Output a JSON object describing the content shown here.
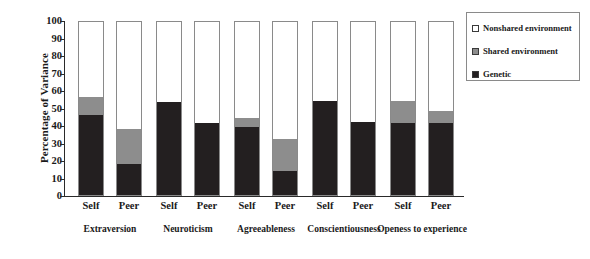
{
  "chart_data": {
    "type": "bar",
    "stacked": true,
    "title": "",
    "xlabel": "",
    "ylabel": "Percentage of Variance",
    "ylim": [
      0,
      100
    ],
    "ytick_step": 10,
    "yticks": [
      0,
      10,
      20,
      30,
      40,
      50,
      60,
      70,
      80,
      90,
      100
    ],
    "grid": false,
    "legend_position": "top-right",
    "categories": [
      "Self",
      "Peer",
      "Self",
      "Peer",
      "Self",
      "Peer",
      "Self",
      "Peer",
      "Self",
      "Peer"
    ],
    "groups": [
      "Extraversion",
      "Neuroticism",
      "Agreeableness",
      "Conscientiousness",
      "Openess to experience"
    ],
    "series": [
      {
        "name": "Genetic",
        "color": "#231f20",
        "values": [
          46,
          18,
          53,
          41,
          39,
          14,
          54,
          42,
          41,
          41
        ]
      },
      {
        "name": "Shared environment",
        "color": "#8d8d8d",
        "values": [
          10,
          20,
          0,
          0,
          5,
          18,
          0,
          0,
          13,
          7
        ]
      },
      {
        "name": "Nonshared environment",
        "color": "#ffffff",
        "values": [
          44,
          62,
          47,
          59,
          56,
          68,
          46,
          58,
          46,
          52
        ]
      }
    ]
  },
  "axis": {
    "y_title": "Percentage of Variance",
    "y_tick_labels": [
      "100",
      "90",
      "80",
      "70",
      "60",
      "50",
      "40",
      "30",
      "20",
      "10",
      "0"
    ]
  },
  "x_axis": {
    "bar_labels": [
      "Self",
      "Peer",
      "Self",
      "Peer",
      "Self",
      "Peer",
      "Self",
      "Peer",
      "Self",
      "Peer"
    ],
    "group_labels": [
      "Extraversion",
      "Neuroticism",
      "Agreeableness",
      "Conscientiousness",
      "Openess to experience"
    ]
  },
  "legend": {
    "items": [
      {
        "label": "Nonshared environment",
        "color": "#ffffff"
      },
      {
        "label": "Shared environment",
        "color": "#8d8d8d"
      },
      {
        "label": "Genetic",
        "color": "#231f20"
      }
    ]
  }
}
